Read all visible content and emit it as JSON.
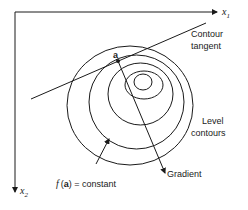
{
  "diagram": {
    "type": "contour-gradient-diagram",
    "axes": {
      "x_axis_label": "x",
      "x_axis_subscript": "1",
      "y_axis_label": "x",
      "y_axis_subscript": "2"
    },
    "point": {
      "label": "a"
    },
    "labels": {
      "contour_tangent_line1": "Contour",
      "contour_tangent_line2": "tangent",
      "level_contours_line1": "Level",
      "level_contours_line2": "contours",
      "gradient": "Gradient",
      "f_italic": "f",
      "f_open": "(",
      "f_arg": "a",
      "f_close": ")",
      "f_rest": " = constant"
    },
    "contours": [
      {
        "cx": 130,
        "cy": 105.5,
        "rx": 63,
        "ry": 59.5
      },
      {
        "cx": 136.5,
        "cy": 102,
        "rx": 47.5,
        "ry": 47
      },
      {
        "cx": 140.5,
        "cy": 94,
        "rx": 32.5,
        "ry": 31
      },
      {
        "cx": 144,
        "cy": 85,
        "rx": 19,
        "ry": 14
      },
      {
        "cx": 143,
        "cy": 82,
        "rx": 9,
        "ry": 8
      }
    ],
    "colors": {
      "ink": "#1a1a1a",
      "background": "#ffffff"
    }
  }
}
